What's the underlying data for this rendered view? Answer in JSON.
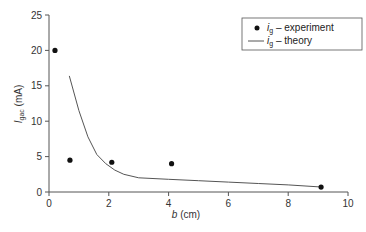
{
  "chart_data": {
    "type": "scatter",
    "title": "",
    "xlabel": "b (cm)",
    "ylabel": "I_gac (mA)",
    "xlim": [
      0,
      10
    ],
    "ylim": [
      0,
      25
    ],
    "xticks": [
      0,
      2,
      4,
      6,
      8,
      10
    ],
    "yticks": [
      0,
      5,
      10,
      15,
      20,
      25
    ],
    "grid": false,
    "legend_position": "upper right",
    "series": [
      {
        "name": "i_g – experiment",
        "type": "scatter",
        "marker": "filled-circle",
        "x": [
          0.2,
          0.7,
          2.1,
          4.1,
          9.1
        ],
        "y": [
          20.0,
          4.5,
          4.2,
          4.0,
          0.7
        ]
      },
      {
        "name": "i_g – theory",
        "type": "line",
        "x": [
          0.68,
          1.0,
          1.3,
          1.6,
          1.9,
          2.2,
          2.5,
          3.0,
          4.0,
          5.0,
          6.0,
          7.0,
          8.0,
          9.1
        ],
        "y": [
          16.4,
          11.5,
          7.8,
          5.3,
          4.0,
          3.1,
          2.5,
          2.0,
          1.8,
          1.6,
          1.4,
          1.2,
          1.0,
          0.7
        ]
      }
    ]
  },
  "labels": {
    "xlabel_var": "b",
    "xlabel_unit": " (cm)",
    "ylabel_var": "I",
    "ylabel_sub": "gac",
    "ylabel_unit": " (mA)",
    "legend_exp_var": "i",
    "legend_exp_sub": "g",
    "legend_exp_text": " – experiment",
    "legend_th_var": "i",
    "legend_th_sub": "g",
    "legend_th_text": " – theory"
  },
  "colors": {
    "axis": "#555555",
    "marker": "#111111",
    "line": "#555555"
  }
}
